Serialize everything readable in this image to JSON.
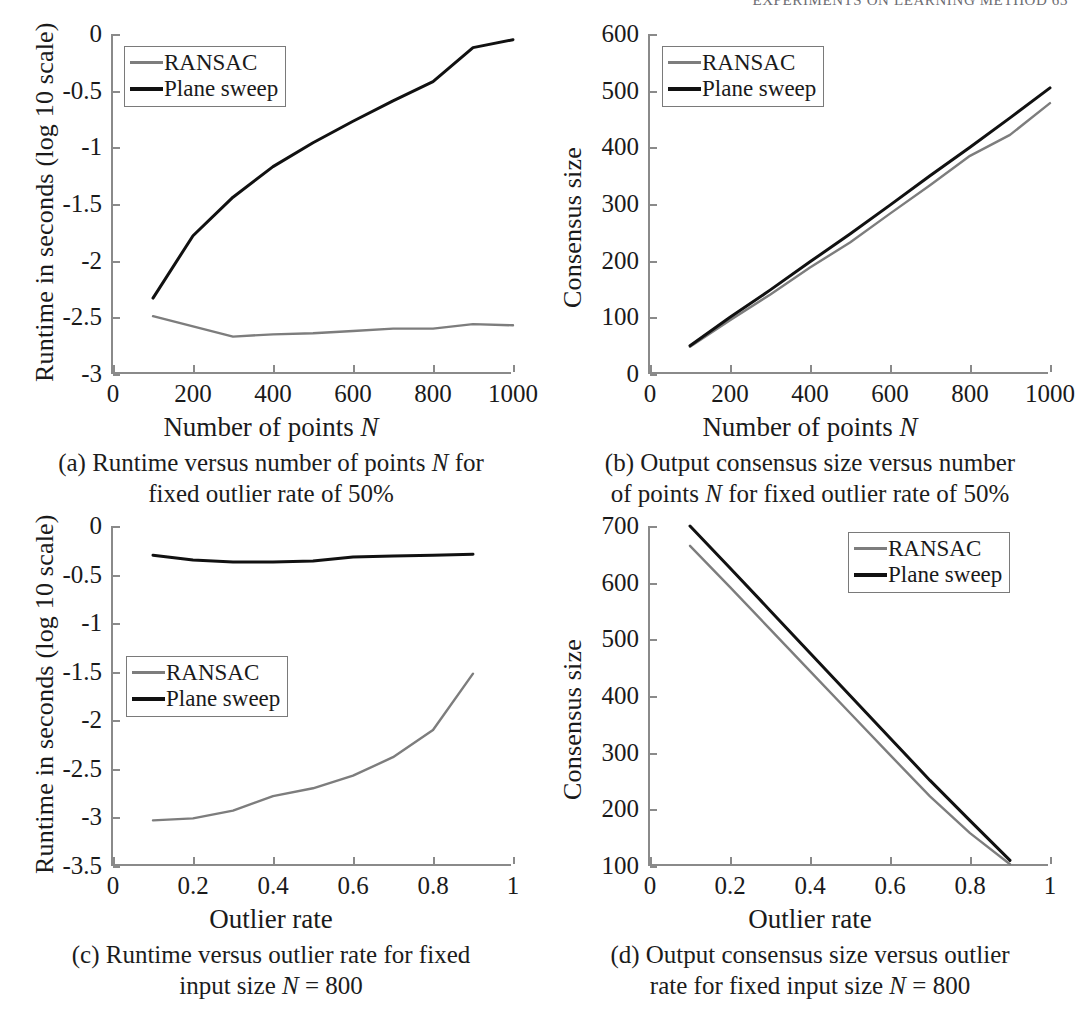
{
  "page": {
    "running_head": "EXPERIMENTS ON LEARNING METHOD   63"
  },
  "legend": {
    "ransac_label": "RANSAC",
    "plane_sweep_label": "Plane sweep",
    "ransac_color": "#7d7d7d",
    "plane_sweep_color": "#111111"
  },
  "panels": {
    "a": {
      "caption_line1": "(a) Runtime versus number of points N for",
      "caption_line2": "fixed outlier rate of 50%"
    },
    "b": {
      "caption_line1": "(b) Output consensus size versus number",
      "caption_line2": "of points N for fixed outlier rate of 50%"
    },
    "c": {
      "caption_line1": "(c) Runtime versus outlier rate for fixed",
      "caption_line2": "input size N = 800"
    },
    "d": {
      "caption_line1": "(d) Output consensus size versus outlier",
      "caption_line2": "rate for fixed input size N = 800"
    }
  },
  "chart_data": [
    {
      "id": "a",
      "type": "line",
      "title": "",
      "xlabel": "Number of points N",
      "ylabel": "Runtime in seconds (log 10 scale)",
      "xlim": [
        0,
        1000
      ],
      "ylim": [
        -3,
        0
      ],
      "xticks": [
        0,
        200,
        400,
        600,
        800,
        1000
      ],
      "xticklabels": [
        "0",
        "200",
        "400",
        "600",
        "800",
        "1000"
      ],
      "yticks": [
        0,
        -0.5,
        -1,
        -1.5,
        -2,
        -2.5,
        -3
      ],
      "yticklabels": [
        "0",
        "-0.5",
        "-1",
        "-1.5",
        "-2",
        "-2.5",
        "-3"
      ],
      "grid": false,
      "legend_position": "top-left",
      "x": [
        100,
        200,
        300,
        400,
        500,
        600,
        700,
        800,
        900,
        1000
      ],
      "series": [
        {
          "name": "RANSAC",
          "color": "#7d7d7d",
          "values": [
            -2.49,
            -2.58,
            -2.67,
            -2.65,
            -2.64,
            -2.62,
            -2.6,
            -2.6,
            -2.56,
            -2.57
          ]
        },
        {
          "name": "Plane sweep",
          "color": "#111111",
          "values": [
            -2.33,
            -1.78,
            -1.44,
            -1.17,
            -0.96,
            -0.77,
            -0.59,
            -0.42,
            -0.12,
            -0.05
          ]
        }
      ]
    },
    {
      "id": "b",
      "type": "line",
      "title": "",
      "xlabel": "Number of points N",
      "ylabel": "Consensus size",
      "xlim": [
        0,
        1000
      ],
      "ylim": [
        0,
        600
      ],
      "xticks": [
        0,
        200,
        400,
        600,
        800,
        1000
      ],
      "xticklabels": [
        "0",
        "200",
        "400",
        "600",
        "800",
        "1000"
      ],
      "yticks": [
        0,
        100,
        200,
        300,
        400,
        500,
        600
      ],
      "yticklabels": [
        "0",
        "100",
        "200",
        "300",
        "400",
        "500",
        "600"
      ],
      "grid": false,
      "legend_position": "top-left",
      "x": [
        100,
        200,
        300,
        400,
        500,
        600,
        700,
        800,
        900,
        1000
      ],
      "series": [
        {
          "name": "RANSAC",
          "color": "#7d7d7d",
          "values": [
            48,
            95,
            140,
            188,
            232,
            283,
            333,
            385,
            422,
            478
          ]
        },
        {
          "name": "Plane sweep",
          "color": "#111111",
          "values": [
            50,
            100,
            148,
            198,
            247,
            298,
            350,
            400,
            452,
            505
          ]
        }
      ]
    },
    {
      "id": "c",
      "type": "line",
      "title": "",
      "xlabel": "Outlier rate",
      "ylabel": "Runtime in seconds (log 10 scale)",
      "xlim": [
        0,
        1
      ],
      "ylim": [
        -3.5,
        0
      ],
      "xticks": [
        0,
        0.2,
        0.4,
        0.6,
        0.8,
        1
      ],
      "xticklabels": [
        "0",
        "0.2",
        "0.4",
        "0.6",
        "0.8",
        "1"
      ],
      "yticks": [
        0,
        -0.5,
        -1,
        -1.5,
        -2,
        -2.5,
        -3,
        -3.5
      ],
      "yticklabels": [
        "0",
        "-0.5",
        "-1",
        "-1.5",
        "-2",
        "-2.5",
        "-3",
        "-3.5"
      ],
      "grid": false,
      "legend_position": "middle-left",
      "x": [
        0.1,
        0.2,
        0.3,
        0.4,
        0.5,
        0.6,
        0.7,
        0.8,
        0.9
      ],
      "series": [
        {
          "name": "RANSAC",
          "color": "#7d7d7d",
          "values": [
            -3.03,
            -3.01,
            -2.93,
            -2.78,
            -2.7,
            -2.57,
            -2.38,
            -2.1,
            -1.52
          ]
        },
        {
          "name": "Plane sweep",
          "color": "#111111",
          "values": [
            -0.3,
            -0.35,
            -0.37,
            -0.37,
            -0.36,
            -0.32,
            -0.31,
            -0.3,
            -0.29
          ]
        }
      ]
    },
    {
      "id": "d",
      "type": "line",
      "title": "",
      "xlabel": "Outlier rate",
      "ylabel": "Consensus size",
      "xlim": [
        0,
        1
      ],
      "ylim": [
        100,
        700
      ],
      "xticks": [
        0,
        0.2,
        0.4,
        0.6,
        0.8,
        1
      ],
      "xticklabels": [
        "0",
        "0.2",
        "0.4",
        "0.6",
        "0.8",
        "1"
      ],
      "yticks": [
        100,
        200,
        300,
        400,
        500,
        600,
        700
      ],
      "yticklabels": [
        "100",
        "200",
        "300",
        "400",
        "500",
        "600",
        "700"
      ],
      "grid": false,
      "legend_position": "top-right",
      "x": [
        0.1,
        0.2,
        0.3,
        0.4,
        0.5,
        0.6,
        0.7,
        0.8,
        0.9
      ],
      "series": [
        {
          "name": "RANSAC",
          "color": "#7d7d7d",
          "values": [
            665,
            592,
            518,
            444,
            370,
            296,
            223,
            158,
            103
          ]
        },
        {
          "name": "Plane sweep",
          "color": "#111111",
          "values": [
            700,
            626,
            551,
            476,
            401,
            326,
            251,
            180,
            110
          ]
        }
      ]
    }
  ]
}
